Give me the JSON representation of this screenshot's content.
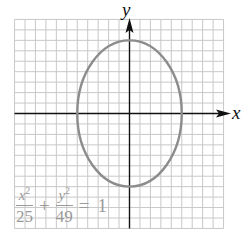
{
  "chart_data": {
    "type": "line",
    "title": "",
    "subtitle": "",
    "xlabel": "x",
    "ylabel": "y",
    "equation": {
      "term1_num": "x",
      "term1_exp": "2",
      "term1_den": "25",
      "plus": "+",
      "term2_num": "y",
      "term2_exp": "2",
      "term2_den": "49",
      "equals": "=",
      "rhs": "1"
    },
    "curve": {
      "kind": "ellipse",
      "center": [
        0,
        0
      ],
      "semi_axis_x": 5,
      "semi_axis_y": 7,
      "color": "#8c8c8c"
    },
    "key_points": [
      {
        "x": 5,
        "y": 0
      },
      {
        "x": -5,
        "y": 0
      },
      {
        "x": 0,
        "y": 7
      },
      {
        "x": 0,
        "y": -7
      }
    ],
    "xlim": [
      -11,
      9.5
    ],
    "ylim": [
      -11,
      9
    ],
    "grid": true,
    "grid_step": 1,
    "tick_labels": false,
    "legend": null,
    "colors": {
      "grid": "#c8c8c8",
      "axes": "#111111",
      "curve": "#8c8c8c",
      "equation_text": "#9a9a9a"
    }
  }
}
